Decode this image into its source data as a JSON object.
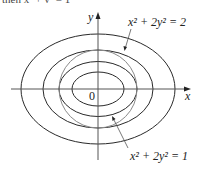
{
  "cropped_text": "then x² + y² = 1",
  "axes": {
    "x_label": "x",
    "y_label": "y",
    "origin_label": "0"
  },
  "labels": {
    "top_curve": "x² + 2y² = 2",
    "bottom_curve": "x² + 2y² = 1"
  },
  "curves": {
    "ellipses": [
      {
        "name": "x^2+2y^2=k1",
        "rx": 26,
        "ry": 17
      },
      {
        "name": "x^2+2y^2=1",
        "rx": 39,
        "ry": 27.5
      },
      {
        "name": "x^2+2y^2=2",
        "rx": 55,
        "ry": 39
      },
      {
        "name": "x^2+2y^2=k4",
        "rx": 77,
        "ry": 55
      }
    ],
    "circle": {
      "name": "x^2+y^2=1",
      "r": 39,
      "color": "#8a8a8a"
    },
    "stroke_color": "#2a2a2a"
  }
}
